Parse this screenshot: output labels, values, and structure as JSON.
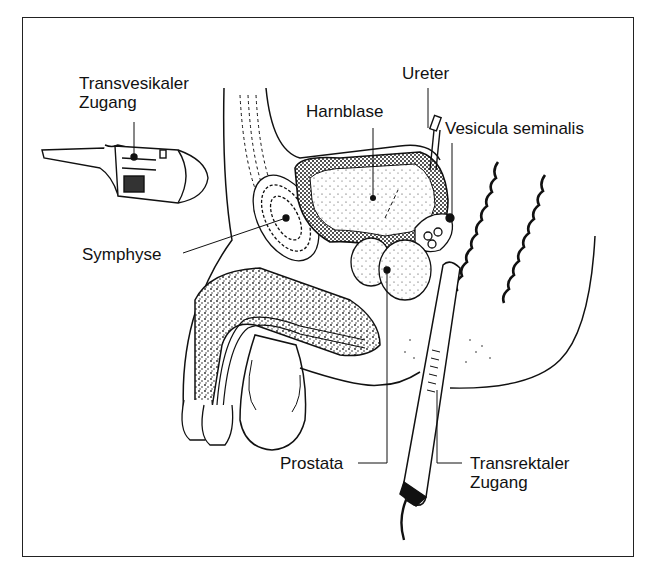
{
  "figure": {
    "type": "anatomical sagittal section, male pelvis",
    "labels": {
      "transvesical_approach": [
        "Transvesikaler",
        "Zugang"
      ],
      "ureter": "Ureter",
      "bladder": "Harnblase",
      "seminal_vesicle": "Vesicula seminalis",
      "symphysis": "Symphyse",
      "prostate": "Prostata",
      "transrectal_approach": [
        "Transrektaler",
        "Zugang"
      ]
    },
    "colors": {
      "ink": "#111111",
      "paper": "#ffffff",
      "stipple": "#333333"
    }
  }
}
